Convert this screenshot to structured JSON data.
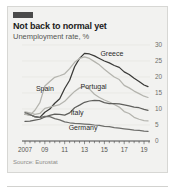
{
  "card": {
    "brand_tab_color": "#4a4a4a",
    "background_color": "#f2f2f0",
    "border_color": "#d7d7d4"
  },
  "header": {
    "title": "Not back to normal yet",
    "subtitle": "Unemployment rate, %"
  },
  "footer": {
    "source": "Source: Eurostat"
  },
  "chart_data": {
    "type": "line",
    "title": "Not back to normal yet",
    "subtitle": "Unemployment rate, %",
    "xlabel": "",
    "ylabel": "Unemployment rate, %",
    "source": "Source: Eurostat",
    "grid": true,
    "legend": "inline-labels",
    "xlim": [
      2007,
      2019.5
    ],
    "ylim": [
      0,
      30
    ],
    "yticks": [
      0,
      5,
      10,
      15,
      20,
      25,
      30
    ],
    "ytick_labels": [
      "0",
      "5",
      "10",
      "15",
      "20",
      "25",
      "30"
    ],
    "xticks": [
      2007,
      2009,
      2011,
      2013,
      2015,
      2017,
      2019
    ],
    "xtick_labels": [
      "2007",
      "09",
      "11",
      "13",
      "15",
      "17",
      "19"
    ],
    "x": [
      2007,
      2007.5,
      2008,
      2008.5,
      2009,
      2009.5,
      2010,
      2010.5,
      2011,
      2011.5,
      2012,
      2012.5,
      2013,
      2013.5,
      2014,
      2014.5,
      2015,
      2015.5,
      2016,
      2016.5,
      2017,
      2017.5,
      2018,
      2018.5,
      2019,
      2019.4
    ],
    "series": [
      {
        "name": "Greece",
        "color": "#3a3a38",
        "label_x": 2014.6,
        "label_y": 26.5,
        "values": [
          8.4,
          8.2,
          7.6,
          7.4,
          9.0,
          10.0,
          11.8,
          13.2,
          16.4,
          19.0,
          23.2,
          25.8,
          27.4,
          27.2,
          26.6,
          25.8,
          25.0,
          24.4,
          23.6,
          23.0,
          21.6,
          20.8,
          19.6,
          18.6,
          17.5,
          17.0
        ]
      },
      {
        "name": "Spain",
        "color": "#b4b4ae",
        "label_x": 2008.1,
        "label_y": 15.5,
        "values": [
          8.3,
          8.1,
          9.6,
          12.0,
          17.2,
          18.6,
          19.9,
          20.4,
          21.0,
          22.6,
          24.6,
          25.8,
          26.3,
          25.8,
          24.8,
          23.8,
          22.4,
          21.2,
          20.0,
          19.2,
          17.4,
          16.6,
          15.6,
          14.8,
          14.0,
          13.6
        ]
      },
      {
        "name": "Portugal",
        "color": "#b4b4ae",
        "label_x": 2012.6,
        "label_y": 16.2,
        "values": [
          9.1,
          8.8,
          8.3,
          8.6,
          10.2,
          10.6,
          11.0,
          11.4,
          12.4,
          14.0,
          15.5,
          16.6,
          17.0,
          16.2,
          14.6,
          13.6,
          12.8,
          12.2,
          11.4,
          10.6,
          9.2,
          8.6,
          7.4,
          6.8,
          6.4,
          6.3
        ]
      },
      {
        "name": "Italy",
        "color": "#5f5f5c",
        "label_x": 2011.6,
        "label_y": 8.0,
        "values": [
          6.1,
          6.2,
          6.5,
          6.8,
          7.5,
          8.0,
          8.4,
          8.3,
          8.1,
          8.8,
          10.4,
          11.2,
          12.1,
          12.5,
          12.7,
          12.6,
          12.0,
          11.7,
          11.7,
          11.6,
          11.3,
          11.0,
          10.6,
          10.4,
          9.9,
          9.6
        ]
      },
      {
        "name": "Germany",
        "color": "#6e6e6b",
        "label_x": 2011.4,
        "label_y": 3.3,
        "values": [
          8.9,
          8.3,
          7.5,
          7.3,
          7.7,
          7.6,
          7.0,
          6.6,
          6.0,
          5.7,
          5.5,
          5.4,
          5.3,
          5.2,
          5.0,
          4.9,
          4.6,
          4.5,
          4.2,
          4.0,
          3.8,
          3.6,
          3.4,
          3.3,
          3.1,
          3.0
        ]
      }
    ]
  }
}
